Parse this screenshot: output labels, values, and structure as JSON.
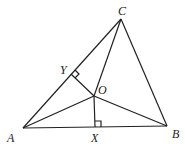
{
  "diagram": {
    "type": "triangle-geometry",
    "points": {
      "A": {
        "label": "A",
        "x": 23,
        "y": 128
      },
      "B": {
        "label": "B",
        "x": 167,
        "y": 126
      },
      "C": {
        "label": "C",
        "x": 121,
        "y": 19
      },
      "O": {
        "label": "O",
        "x": 94,
        "y": 96
      },
      "X": {
        "label": "X",
        "x": 95,
        "y": 127
      },
      "Y": {
        "label": "Y",
        "x": 71,
        "y": 74
      }
    },
    "segments": [
      "AB",
      "BC",
      "CA",
      "OA",
      "OB",
      "OC",
      "OX",
      "OY"
    ],
    "right_angles": [
      "OXB",
      "OYC"
    ],
    "line_color": "#222222"
  }
}
